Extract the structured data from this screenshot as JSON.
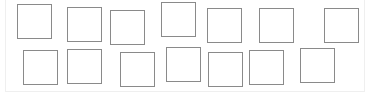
{
  "canvas": {
    "border_color": "#efefef",
    "background": "#ffffff"
  },
  "box_style": {
    "border_color": "#8a8a8a",
    "size": 35
  },
  "boxes": [
    {
      "row": 1,
      "index": 1,
      "x": 17,
      "y": 4
    },
    {
      "row": 1,
      "index": 2,
      "x": 67,
      "y": 7
    },
    {
      "row": 1,
      "index": 3,
      "x": 110,
      "y": 10
    },
    {
      "row": 1,
      "index": 4,
      "x": 161,
      "y": 2
    },
    {
      "row": 1,
      "index": 5,
      "x": 207,
      "y": 8
    },
    {
      "row": 1,
      "index": 6,
      "x": 259,
      "y": 8
    },
    {
      "row": 1,
      "index": 7,
      "x": 324,
      "y": 8
    },
    {
      "row": 2,
      "index": 1,
      "x": 23,
      "y": 50
    },
    {
      "row": 2,
      "index": 2,
      "x": 67,
      "y": 49
    },
    {
      "row": 2,
      "index": 3,
      "x": 120,
      "y": 52
    },
    {
      "row": 2,
      "index": 4,
      "x": 166,
      "y": 47
    },
    {
      "row": 2,
      "index": 5,
      "x": 208,
      "y": 52
    },
    {
      "row": 2,
      "index": 6,
      "x": 249,
      "y": 50
    },
    {
      "row": 2,
      "index": 7,
      "x": 300,
      "y": 48
    }
  ]
}
